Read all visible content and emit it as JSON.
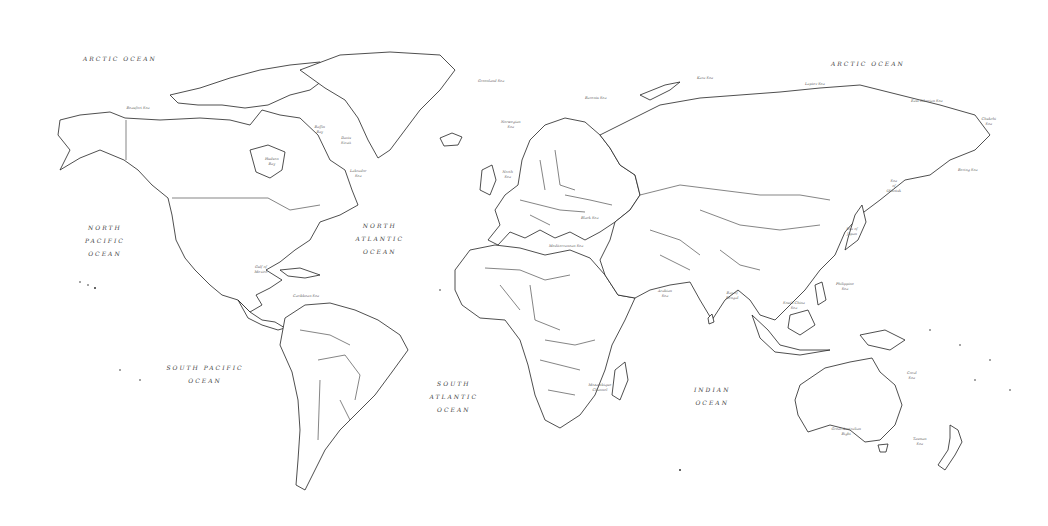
{
  "map": {
    "title": "World Map (outline)",
    "oceans": [
      {
        "id": "arctic-ocean-west",
        "label": "ARCTIC OCEAN",
        "x": 120,
        "y": 58
      },
      {
        "id": "arctic-ocean-east",
        "label": "ARCTIC OCEAN",
        "x": 868,
        "y": 63
      },
      {
        "id": "north-pacific-ocean",
        "label": "NORTH\nPACIFIC\nOCEAN",
        "x": 105,
        "y": 240
      },
      {
        "id": "north-atlantic-ocean",
        "label": "NORTH\nATLANTIC\nOCEAN",
        "x": 380,
        "y": 238
      },
      {
        "id": "south-pacific-ocean",
        "label": "SOUTH PACIFIC\nOCEAN",
        "x": 205,
        "y": 374
      },
      {
        "id": "south-atlantic-ocean",
        "label": "SOUTH\nATLANTIC\nOCEAN",
        "x": 454,
        "y": 396
      },
      {
        "id": "indian-ocean",
        "label": "INDIAN\nOCEAN",
        "x": 712,
        "y": 396
      }
    ],
    "seas": [
      {
        "id": "beaufort-sea",
        "label": "Beaufort Sea",
        "x": 138,
        "y": 108
      },
      {
        "id": "baffin-bay",
        "label": "Baffin\nBay",
        "x": 320,
        "y": 130
      },
      {
        "id": "davis-strait",
        "label": "Davis\nStrait",
        "x": 346,
        "y": 141
      },
      {
        "id": "hudson-bay",
        "label": "Hudson\nBay",
        "x": 272,
        "y": 162
      },
      {
        "id": "labrador-sea",
        "label": "Labrador\nSea",
        "x": 358,
        "y": 174
      },
      {
        "id": "greenland-sea",
        "label": "Greenland Sea",
        "x": 491,
        "y": 81
      },
      {
        "id": "barents-sea",
        "label": "Barents Sea",
        "x": 596,
        "y": 98
      },
      {
        "id": "kara-sea",
        "label": "Kara Sea",
        "x": 705,
        "y": 78
      },
      {
        "id": "norwegian-sea",
        "label": "Norwegian\nSea",
        "x": 511,
        "y": 125
      },
      {
        "id": "north-sea",
        "label": "North\nSea",
        "x": 508,
        "y": 175
      },
      {
        "id": "laptev-sea",
        "label": "Laptev Sea",
        "x": 815,
        "y": 84
      },
      {
        "id": "east-siberian-sea",
        "label": "East Siberian Sea",
        "x": 927,
        "y": 101
      },
      {
        "id": "chukchi-sea",
        "label": "Chukchi\nSea",
        "x": 989,
        "y": 122
      },
      {
        "id": "bering-sea",
        "label": "Bering Sea",
        "x": 968,
        "y": 170
      },
      {
        "id": "sea-of-okhotsk",
        "label": "Sea\nof\nOkhotsk",
        "x": 894,
        "y": 186
      },
      {
        "id": "sea-of-japan",
        "label": "Sea of\nJapan",
        "x": 852,
        "y": 232
      },
      {
        "id": "black-sea",
        "label": "Black Sea",
        "x": 590,
        "y": 218
      },
      {
        "id": "mediterranean-sea",
        "label": "Mediterranean Sea",
        "x": 566,
        "y": 246
      },
      {
        "id": "gulf-of-mexico",
        "label": "Gulf of\nMexico",
        "x": 261,
        "y": 270
      },
      {
        "id": "caribbean-sea",
        "label": "Caribbean Sea",
        "x": 306,
        "y": 296
      },
      {
        "id": "arabian-sea",
        "label": "Arabian\nSea",
        "x": 665,
        "y": 294
      },
      {
        "id": "bay-of-bengal",
        "label": "Bay of\nBengal",
        "x": 732,
        "y": 296
      },
      {
        "id": "south-china-sea",
        "label": "South China\nSea",
        "x": 794,
        "y": 306
      },
      {
        "id": "philippine-sea",
        "label": "Philippine\nSea",
        "x": 845,
        "y": 287
      },
      {
        "id": "mozambique-channel",
        "label": "Mozambique\nChannel",
        "x": 600,
        "y": 388
      },
      {
        "id": "coral-sea",
        "label": "Coral\nSea",
        "x": 912,
        "y": 376
      },
      {
        "id": "great-australian-bight",
        "label": "Great Australian\nBight",
        "x": 846,
        "y": 432
      },
      {
        "id": "tasman-sea",
        "label": "Tasman\nSea",
        "x": 920,
        "y": 442
      }
    ]
  }
}
